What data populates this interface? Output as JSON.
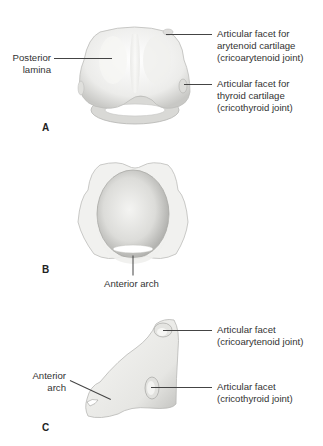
{
  "figure": {
    "panels": [
      {
        "letter": "A",
        "view": "posterior",
        "labels": [
          {
            "id": "posterior_lamina",
            "line1": "Posterior",
            "line2": "lamina"
          },
          {
            "id": "facet_arytenoid",
            "line1": "Articular facet for",
            "line2": "arytenoid cartilage",
            "line3": "(cricoarytenoid joint)"
          },
          {
            "id": "facet_thyroid",
            "line1": "Articular facet for",
            "line2": "thyroid cartilage",
            "line3": "(cricothyroid joint)"
          }
        ]
      },
      {
        "letter": "B",
        "view": "superior",
        "labels": [
          {
            "id": "anterior_arch",
            "line1": "Anterior arch"
          }
        ]
      },
      {
        "letter": "C",
        "view": "lateral",
        "labels": [
          {
            "id": "anterior_arch_c",
            "line1": "Anterior",
            "line2": "arch"
          },
          {
            "id": "facet_cricoarytenoid",
            "line1": "Articular facet",
            "line2": "(cricoarytenoid joint)"
          },
          {
            "id": "facet_cricothyroid",
            "line1": "Articular facet",
            "line2": "(cricothyroid joint)"
          }
        ]
      }
    ],
    "colors": {
      "cartilage_fill": "#f2f2f0",
      "cartilage_shade": "#c9c9c6",
      "leader_line": "#444444",
      "text": "#333333"
    }
  }
}
